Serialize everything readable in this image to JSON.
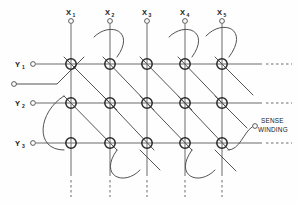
{
  "diagram": {
    "background_color": "#fefefe",
    "line_color": "#4a4a4a",
    "core_color": "#2a2a2a",
    "text_color": "#1a1a1a",
    "width": 298,
    "height": 205
  },
  "x_drive_lines": [
    {
      "id": "x1",
      "label": "X",
      "subscript": "1",
      "x": 71,
      "terminal_y": 21,
      "top_y": 14,
      "bottom_y": 176,
      "dash_end_y": 196
    },
    {
      "id": "x2",
      "label": "X",
      "subscript": "2",
      "x": 110,
      "terminal_y": 21,
      "top_y": 14,
      "bottom_y": 176,
      "dash_end_y": 196
    },
    {
      "id": "x3",
      "label": "X",
      "subscript": "3",
      "x": 147,
      "terminal_y": 21,
      "top_y": 14,
      "bottom_y": 176,
      "dash_end_y": 196
    },
    {
      "id": "x4",
      "label": "X",
      "subscript": "4",
      "x": 185,
      "terminal_y": 21,
      "top_y": 14,
      "bottom_y": 176,
      "dash_end_y": 196
    },
    {
      "id": "x5",
      "label": "X",
      "subscript": "5",
      "x": 222,
      "terminal_y": 21,
      "top_y": 14,
      "bottom_y": 176,
      "dash_end_y": 196
    }
  ],
  "y_drive_lines": [
    {
      "id": "y1",
      "label": "Y",
      "subscript": "1",
      "y": 64,
      "terminal_x": 33,
      "label_x": 20,
      "line_start_x": 38,
      "line_end_x": 262,
      "dash_end_x": 292
    },
    {
      "id": "y2",
      "label": "Y",
      "subscript": "2",
      "y": 103,
      "terminal_x": 33,
      "label_x": 20,
      "line_start_x": 38,
      "line_end_x": 262,
      "dash_end_x": 292
    },
    {
      "id": "y3",
      "label": "Y",
      "subscript": "3",
      "y": 143,
      "terminal_x": 33,
      "label_x": 20,
      "line_start_x": 38,
      "line_end_x": 262,
      "dash_end_x": 292
    }
  ],
  "cores": [
    {
      "row": "y1",
      "col": "x1",
      "cx": 71,
      "cy": 64
    },
    {
      "row": "y1",
      "col": "x2",
      "cx": 110,
      "cy": 64
    },
    {
      "row": "y1",
      "col": "x3",
      "cx": 147,
      "cy": 64
    },
    {
      "row": "y1",
      "col": "x4",
      "cx": 185,
      "cy": 64
    },
    {
      "row": "y1",
      "col": "x5",
      "cx": 222,
      "cy": 64
    },
    {
      "row": "y2",
      "col": "x1",
      "cx": 71,
      "cy": 103
    },
    {
      "row": "y2",
      "col": "x2",
      "cx": 110,
      "cy": 103
    },
    {
      "row": "y2",
      "col": "x3",
      "cx": 147,
      "cy": 103
    },
    {
      "row": "y2",
      "col": "x4",
      "cx": 185,
      "cy": 103
    },
    {
      "row": "y2",
      "col": "x5",
      "cx": 222,
      "cy": 103
    },
    {
      "row": "y3",
      "col": "x1",
      "cx": 71,
      "cy": 143
    },
    {
      "row": "y3",
      "col": "x2",
      "cx": 110,
      "cy": 143
    },
    {
      "row": "y3",
      "col": "x3",
      "cx": 147,
      "cy": 143
    },
    {
      "row": "y3",
      "col": "x4",
      "cx": 185,
      "cy": 143
    },
    {
      "row": "y3",
      "col": "x5",
      "cx": 222,
      "cy": 143
    }
  ],
  "core_radius": 5.2,
  "sense_winding": {
    "label_line1": "SENSE",
    "label_line2": "WINDING",
    "label_x": 262,
    "label_y1": 122,
    "label_y2": 131,
    "terminal_right": {
      "cx": 256,
      "cy": 126
    },
    "terminal_left": {
      "cx": 14,
      "cy": 84
    },
    "path": "M 14 84 L 57 84 L 83 58 M 71 64 L 110 103 M 71 103 L 110 143 M 110 64 C 126 40 104 28 93 40 L 71 64 M 147 64 L 185 103 M 147 103 L 185 143 M 185 64 C 201 40 179 28 168 40 L 147 64 M 222 64 C 240 38 216 26 205 39 L 185 64 M 110 143 C 96 166 118 178 130 165 L 147 143 M 185 143 C 171 166 193 178 205 165 L 222 143 M 222 103 L 247 128 M 147 143 L 185 103 M 110 103 L 147 64 M 71 143 C 50 160 28 146 38 131 L 71 103 M 185 103 L 222 64 M 222 143 L 256 126"
  },
  "sense_segments": [
    {
      "name": "lead-in-left",
      "d": "M 14 84 L 57 84 L 84 57"
    },
    {
      "name": "diag-r1c1-to-r2c2",
      "d": "M 71 64 L 110 103"
    },
    {
      "name": "diag-r2c1-to-r3c2",
      "d": "M 71 103 L 110 143"
    },
    {
      "name": "uturn-top-c2",
      "d": "M 110 64 C 128 40 106 25 94 38"
    },
    {
      "name": "diag-r1c3-to-r2c4",
      "d": "M 147 64 L 185 103"
    },
    {
      "name": "diag-r2c3-to-r3c4",
      "d": "M 147 103 L 185 143"
    },
    {
      "name": "uturn-top-c4",
      "d": "M 185 64 C 203 40 181 25 169 38"
    },
    {
      "name": "uturn-top-c5",
      "d": "M 222 64 C 242 38 218 24 206 38"
    },
    {
      "name": "diag-r1c2-to-r2c3",
      "d": "M 110 64 L 147 103"
    },
    {
      "name": "diag-r2c2-to-r3c3",
      "d": "M 110 103 L 147 143"
    },
    {
      "name": "diag-r1c4-to-r2c5",
      "d": "M 185 64 L 222 103"
    },
    {
      "name": "diag-r2c4-to-r3c5",
      "d": "M 185 103 L 222 143"
    },
    {
      "name": "uturn-bottom-c2c3",
      "d": "M 110 143 C 94 168 120 180 132 166"
    },
    {
      "name": "uturn-bottom-c4c5",
      "d": "M 185 143 C 169 168 195 180 207 166"
    },
    {
      "name": "uturn-left-r2r3",
      "d": "M 71 103 C 46 120 28 148 46 155"
    },
    {
      "name": "lead-out-right",
      "d": "M 222 143 C 238 143 244 132 252 127"
    }
  ],
  "annotations": {
    "continuation_dashes_right": 3,
    "continuation_dashes_bottom": 5
  }
}
